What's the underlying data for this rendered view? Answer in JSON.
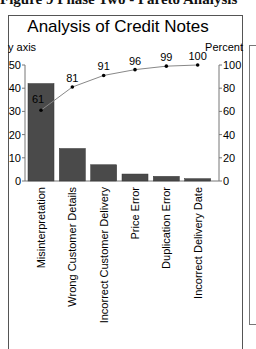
{
  "figure_caption": "Figure 9 Phase Two - Pareto Analysis",
  "chart_data": {
    "type": "bar",
    "title": "Analysis of Credit Notes",
    "xlabel": "",
    "ylabel": "y axis",
    "y2label": "Percent",
    "categories": [
      "Misinterpretation",
      "Wrong Customer Details",
      "Incorrect Customer Delivery",
      "Price Error",
      "Duplication Error",
      "Incorrect Delivery Date"
    ],
    "series": [
      {
        "name": "Count",
        "type": "bar",
        "values": [
          42,
          14,
          7,
          3,
          2,
          1
        ],
        "color": "#4a4a4a"
      },
      {
        "name": "Cumulative Percent",
        "type": "line",
        "axis": "right",
        "values": [
          61,
          81,
          91,
          96,
          99,
          100
        ],
        "color": "#888888"
      }
    ],
    "ylim": [
      0,
      50
    ],
    "y2lim": [
      0,
      100
    ],
    "yticks": [
      0,
      10,
      20,
      30,
      40,
      50
    ],
    "y2ticks": [
      0,
      20,
      40,
      60,
      80,
      100
    ],
    "grid": false,
    "legend": "none"
  }
}
